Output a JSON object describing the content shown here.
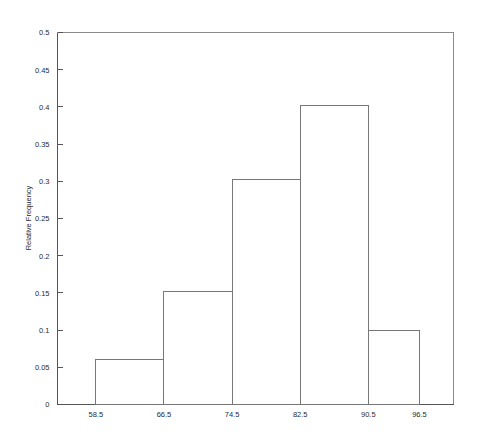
{
  "chart_data": {
    "type": "bar",
    "title": "",
    "subtitle": "",
    "xlabel": "",
    "ylabel": "Relative Frequency",
    "grid": false,
    "legend": false,
    "legend_position": "none",
    "style": "histogram-outline",
    "bar_fill": "none",
    "bar_stroke": "#777777",
    "background": "#ffffff",
    "xlim": [
      54.0,
      100.5
    ],
    "ylim": [
      0,
      0.5
    ],
    "ytick_values": [
      0,
      0.05,
      0.1,
      0.15,
      0.2,
      0.25,
      0.3,
      0.35,
      0.4,
      0.45,
      0.5
    ],
    "ytick_labels": [
      "0",
      "0.05",
      "0.1",
      "0.15",
      "0.2",
      "0.25",
      "0.3",
      "0.35",
      "0.4",
      "0.45",
      "0.5"
    ],
    "xtick_values": [
      58.5,
      66.5,
      74.5,
      82.5,
      90.5,
      96.5
    ],
    "xtick_labels": [
      "58.5",
      "66.5",
      "74.5",
      "82.5",
      "90.5",
      "96.5"
    ],
    "bin_edges": [
      58.5,
      66.5,
      74.5,
      82.5,
      90.5,
      96.5
    ],
    "categories": [
      "58.5-66.5",
      "66.5-74.5",
      "74.5-82.5",
      "82.5-90.5",
      "90.5-96.5"
    ],
    "values": [
      0.061,
      0.152,
      0.303,
      0.402,
      0.1
    ],
    "bars": [
      {
        "label": "58.5-66.5",
        "x0": 58.5,
        "x1": 66.5,
        "value": 0.061
      },
      {
        "label": "66.5-74.5",
        "x0": 66.5,
        "x1": 74.5,
        "value": 0.152
      },
      {
        "label": "74.5-82.5",
        "x0": 74.5,
        "x1": 82.5,
        "value": 0.303
      },
      {
        "label": "82.5-90.5",
        "x0": 82.5,
        "x1": 90.5,
        "value": 0.402
      },
      {
        "label": "90.5-96.5",
        "x0": 90.5,
        "x1": 96.5,
        "value": 0.1
      }
    ]
  }
}
